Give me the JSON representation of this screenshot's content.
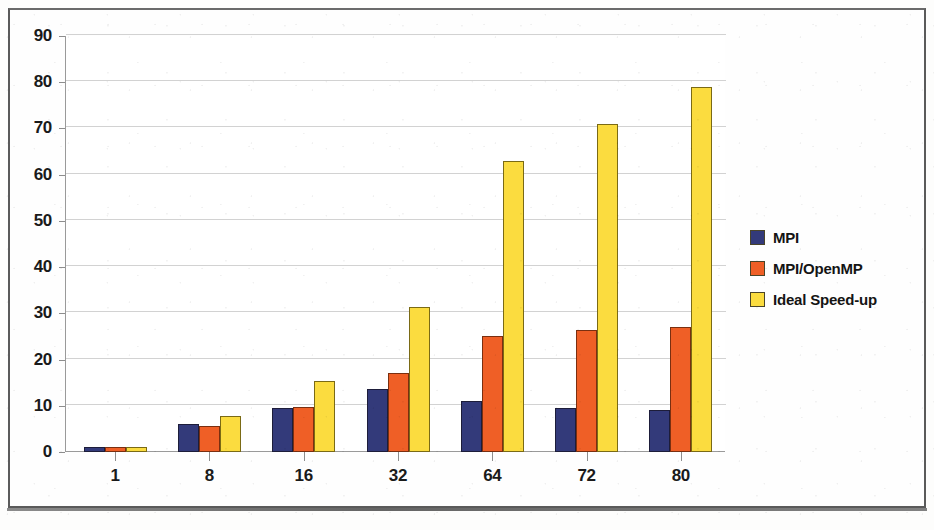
{
  "chart_data": {
    "type": "bar",
    "title": "",
    "xlabel": "",
    "ylabel": "",
    "categories": [
      "1",
      "8",
      "16",
      "32",
      "64",
      "72",
      "80"
    ],
    "ylim": [
      0,
      90
    ],
    "yticks": [
      0,
      10,
      20,
      30,
      40,
      50,
      60,
      70,
      80,
      90
    ],
    "grid": true,
    "legend_position": "right",
    "series": [
      {
        "name": "MPI",
        "color": "#333a7a",
        "values": [
          1,
          6,
          9.5,
          13.6,
          11,
          9.5,
          9
        ]
      },
      {
        "name": "MPI/OpenMP",
        "color": "#ef5f26",
        "values": [
          1,
          5.7,
          9.7,
          17.2,
          25,
          26.3,
          27
        ]
      },
      {
        "name": "Ideal  Speed-up",
        "color": "#fbdc3f",
        "values": [
          1,
          7.8,
          15.4,
          31.3,
          63,
          71,
          79
        ]
      }
    ]
  },
  "legend": {
    "items": [
      {
        "label": "MPI",
        "color": "#333a7a"
      },
      {
        "label": "MPI/OpenMP",
        "color": "#ef5f26"
      },
      {
        "label": "Ideal  Speed-up",
        "color": "#fbdc3f"
      }
    ]
  }
}
